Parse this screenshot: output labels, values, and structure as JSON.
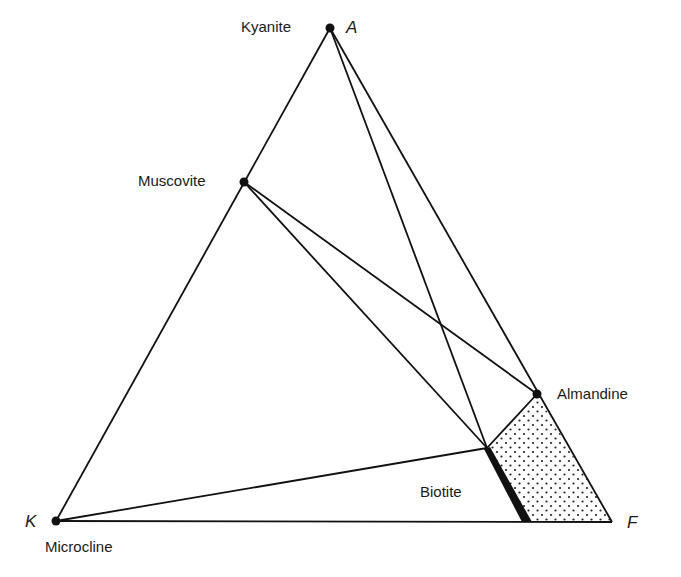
{
  "diagram": {
    "type": "AKF ternary phase diagram",
    "corners": {
      "A": {
        "label": "A",
        "x": 330,
        "y": 28
      },
      "K": {
        "label": "K",
        "x": 56,
        "y": 521
      },
      "F": {
        "label": "F",
        "x": 612,
        "y": 522
      }
    },
    "phases": {
      "kyanite": {
        "label": "Kyanite",
        "x": 330,
        "y": 28
      },
      "muscovite": {
        "label": "Muscovite",
        "x": 244,
        "y": 182
      },
      "almandine": {
        "label": "Almandine",
        "x": 537,
        "y": 394
      },
      "biotite": {
        "label": "Biotite",
        "x_top": 487,
        "y_top": 448,
        "x_bottom": 527,
        "y_bottom": 521
      },
      "microcline": {
        "label": "Microcline",
        "x": 56,
        "y": 521
      }
    },
    "tie_lines": [
      [
        "kyanite",
        "almandine"
      ],
      [
        "kyanite",
        "biotite-top"
      ],
      [
        "muscovite",
        "almandine"
      ],
      [
        "muscovite",
        "biotite-top"
      ],
      [
        "microcline",
        "biotite-top"
      ],
      [
        "biotite-top",
        "almandine"
      ]
    ],
    "shaded_region": "Biotite–Almandine–F (stippled)",
    "colors": {
      "line": "#111111",
      "background": "#ffffff",
      "stipple": "#222222"
    }
  }
}
